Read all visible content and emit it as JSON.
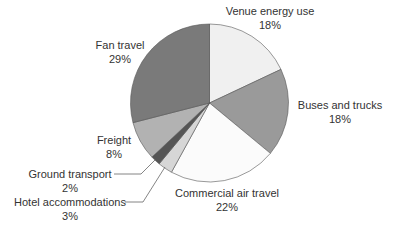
{
  "chart_data": {
    "type": "pie",
    "title": "",
    "start_angle_deg": 0,
    "direction": "clockwise",
    "slices": [
      {
        "label": "Venue energy use",
        "value": 18,
        "display": "18%",
        "color": "#f0f0f0"
      },
      {
        "label": "Buses and trucks",
        "value": 18,
        "display": "18%",
        "color": "#9a9a9a"
      },
      {
        "label": "Commercial air travel",
        "value": 22,
        "display": "22%",
        "color": "#fbfbfb"
      },
      {
        "label": "Hotel accommodations",
        "value": 3,
        "display": "3%",
        "color": "#d6d6d6"
      },
      {
        "label": "Ground transport",
        "value": 2,
        "display": "2%",
        "color": "#555555"
      },
      {
        "label": "Freight",
        "value": 8,
        "display": "8%",
        "color": "#b2b2b2"
      },
      {
        "label": "Fan travel",
        "value": 29,
        "display": "29%",
        "color": "#7a7a7a"
      }
    ],
    "legend": "none (direct labels)",
    "units": "%"
  },
  "labels": [
    {
      "name": "Venue energy use",
      "pct": "18%",
      "x": 270,
      "y": 4
    },
    {
      "name": "Buses and trucks",
      "pct": "18%",
      "x": 340,
      "y": 98
    },
    {
      "name": "Commercial air travel",
      "pct": "22%",
      "x": 227,
      "y": 186
    },
    {
      "name": "Hotel accommodations",
      "pct": "3%",
      "x": 70,
      "y": 195
    },
    {
      "name": "Ground transport",
      "pct": "2%",
      "x": 70,
      "y": 167
    },
    {
      "name": "Freight",
      "pct": "8%",
      "x": 114,
      "y": 133
    },
    {
      "name": "Fan travel",
      "pct": "29%",
      "x": 120,
      "y": 38
    }
  ]
}
